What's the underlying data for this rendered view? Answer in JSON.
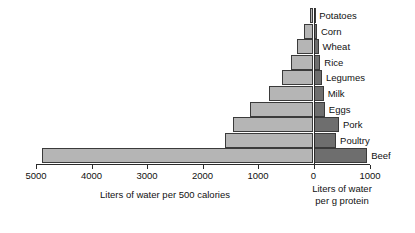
{
  "chart_data": {
    "type": "bar",
    "orientation": "horizontal-diverging",
    "title": "",
    "categories": [
      "Potatoes",
      "Corn",
      "Wheat",
      "Rice",
      "Legumes",
      "Milk",
      "Eggs",
      "Pork",
      "Poultry",
      "Beef"
    ],
    "series": [
      {
        "name": "Liters of water per 500 calories",
        "side": "left",
        "color": "#b5b5b5",
        "values": [
          60,
          170,
          300,
          400,
          560,
          800,
          1150,
          1450,
          1600,
          4900
        ]
      },
      {
        "name": "Liters of water per g protein",
        "side": "right",
        "color": "#6e6e6e",
        "values": [
          30,
          60,
          90,
          120,
          150,
          180,
          200,
          450,
          400,
          950
        ]
      }
    ],
    "left_axis": {
      "label": "Liters of water per 500 calories",
      "ticks": [
        5000,
        4000,
        3000,
        2000,
        1000,
        0
      ],
      "tick_labels": [
        "5000",
        "4000",
        "3000",
        "2000",
        "1000",
        "0"
      ],
      "range": [
        5000,
        0
      ]
    },
    "right_axis": {
      "label_line1": "Liters of water",
      "label_line2": "per g protein",
      "ticks": [
        0,
        1000
      ],
      "tick_labels": [
        "0",
        "1000"
      ],
      "range": [
        0,
        1000
      ]
    },
    "grid": false,
    "legend": "none",
    "colors": {
      "left_bar": "#b5b5b5",
      "right_bar": "#6e6e6e",
      "outline": "#3a3a3a",
      "axis": "#2b2b2b",
      "text": "#111111",
      "background": "#ffffff"
    }
  }
}
